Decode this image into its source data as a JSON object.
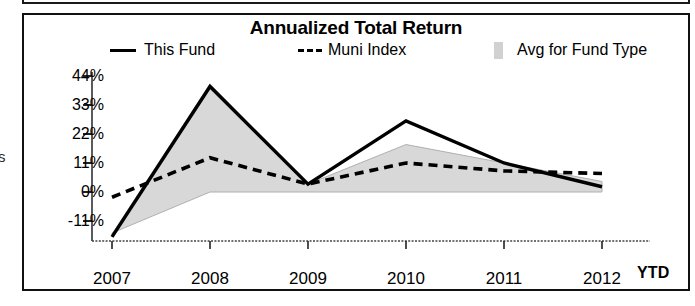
{
  "chart_data": {
    "type": "line",
    "title": "Annualized Total Return",
    "xlabel": "",
    "ylabel": "",
    "grid": false,
    "legend_position": "top",
    "categories": [
      "2007",
      "2008",
      "2009",
      "2010",
      "2011",
      "2012"
    ],
    "x_axis_suffix": "YTD",
    "ytick_labels": [
      "44%",
      "33%",
      "22%",
      "11%",
      "0%",
      "-11%"
    ],
    "ytick_values": [
      44,
      33,
      22,
      11,
      0,
      -11
    ],
    "ylim": [
      -22,
      48
    ],
    "series": [
      {
        "name": "This Fund",
        "style": "solid",
        "color": "#000000",
        "values": [
          -17,
          40,
          3,
          27,
          11,
          2
        ]
      },
      {
        "name": "Muni Index",
        "style": "dashed",
        "color": "#000000",
        "values": [
          -2,
          13,
          3,
          11,
          8,
          7
        ]
      },
      {
        "name": "Avg for Fund Type",
        "style": "band",
        "color": "#c9c9c9",
        "upper": [
          -16,
          41,
          3,
          18,
          11,
          4
        ],
        "lower": [
          -22,
          0,
          0,
          0,
          0,
          0
        ]
      }
    ]
  },
  "legend": {
    "items": [
      {
        "label": "This Fund",
        "swatch": "solid-line-swatch"
      },
      {
        "label": "Muni Index",
        "swatch": "dashed-line-swatch"
      },
      {
        "label": "Avg for Fund Type",
        "swatch": "shaded-band-swatch"
      }
    ]
  },
  "axis": {
    "y_labels": [
      "44%",
      "33%",
      "22%",
      "11%",
      "0%",
      "-11%"
    ],
    "x_labels": [
      "2007",
      "2008",
      "2009",
      "2010",
      "2011",
      "2012"
    ],
    "ytd": "YTD"
  },
  "artifacts": {
    "margin_glyph": "s"
  },
  "colors": {
    "line": "#000000",
    "band": "#c9c9c9",
    "border": "#111111",
    "background": "#ffffff"
  }
}
